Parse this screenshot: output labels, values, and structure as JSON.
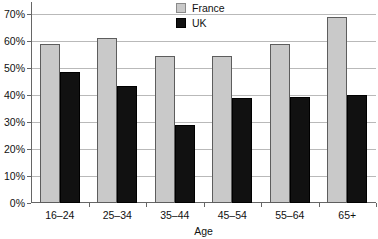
{
  "chart_data": {
    "type": "bar",
    "title": "",
    "xlabel": "Age",
    "ylabel": "",
    "categories": [
      "16–24",
      "25–34",
      "35–44",
      "45–54",
      "55–64",
      "65+"
    ],
    "series": [
      {
        "name": "France",
        "color": "#c9c9c9",
        "values": [
          59,
          61.3,
          54.5,
          54.5,
          59,
          69
        ]
      },
      {
        "name": "UK",
        "color": "#111111",
        "values": [
          48.5,
          43.5,
          29,
          39,
          39.3,
          40
        ]
      }
    ],
    "ylim": [
      0,
      70
    ],
    "ytick_labels": [
      "70%",
      "60%",
      "50%",
      "40%",
      "30%",
      "20%",
      "10%",
      "0%"
    ],
    "ytick_values": [
      70,
      60,
      50,
      40,
      30,
      20,
      10,
      0
    ],
    "grid": true,
    "legend_position": "top-center"
  },
  "legend": {
    "items": [
      {
        "label": "France",
        "swatch": "france-swatch"
      },
      {
        "label": "UK",
        "swatch": "uk-swatch"
      }
    ]
  },
  "axis": {
    "x_title": "Age"
  }
}
